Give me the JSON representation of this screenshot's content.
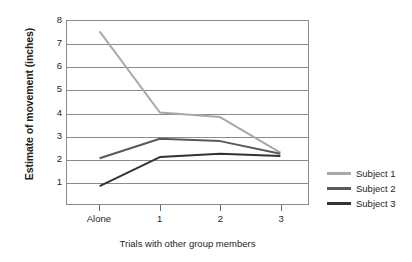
{
  "chart_data": {
    "type": "line",
    "title": "",
    "xlabel": "Trials with other group members",
    "ylabel": "Estimate of movement (inches)",
    "categories": [
      "Alone",
      "1",
      "2",
      "3"
    ],
    "xtick_labels": [
      "Alone",
      "1",
      "2",
      "3"
    ],
    "ytick_labels": [
      "1",
      "2",
      "3",
      "4",
      "5",
      "6",
      "7",
      "8"
    ],
    "ylim": [
      0,
      8
    ],
    "yticks": [
      1,
      2,
      3,
      4,
      5,
      6,
      7,
      8
    ],
    "grid": "horizontal",
    "legend_position": "right",
    "series": [
      {
        "name": "Subject 1",
        "color": "#a8a8a8",
        "width": 2.0,
        "values": [
          7.55,
          4.0,
          3.8,
          2.25
        ]
      },
      {
        "name": "Subject 2",
        "color": "#595959",
        "width": 2.0,
        "values": [
          2.0,
          2.85,
          2.75,
          2.2
        ]
      },
      {
        "name": "Subject 3",
        "color": "#333333",
        "width": 2.0,
        "values": [
          0.78,
          2.05,
          2.2,
          2.1
        ]
      }
    ]
  },
  "legend": {
    "entries": [
      {
        "label": "Subject 1"
      },
      {
        "label": "Subject 2"
      },
      {
        "label": "Subject 3"
      }
    ]
  },
  "colors": {
    "axis": "#8a8a8a",
    "text": "#231f20",
    "background": "#ffffff",
    "series_1": "#a8a8a8",
    "series_2": "#595959",
    "series_3": "#333333"
  }
}
